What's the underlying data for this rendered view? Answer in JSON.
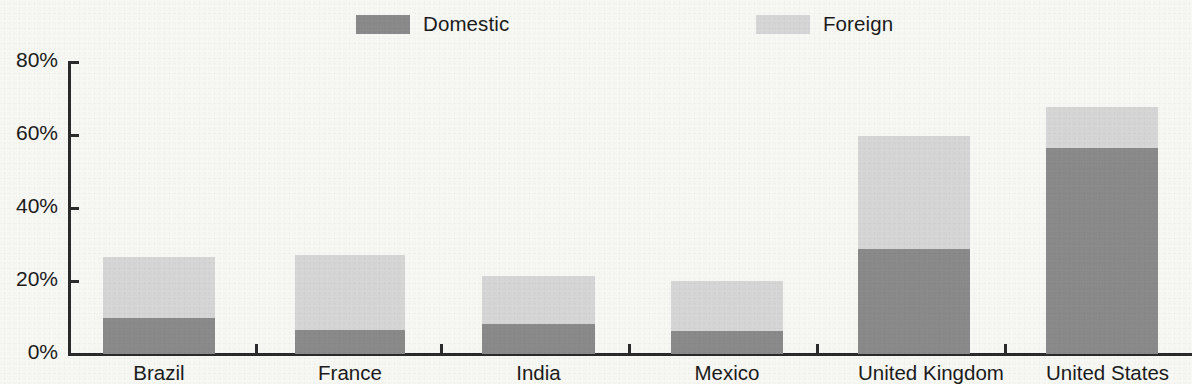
{
  "legend": {
    "position": "top",
    "entries": [
      {
        "label": "Domestic",
        "key": "domestic",
        "color": "#8a8a8a",
        "icon": "legend-swatch-icon"
      },
      {
        "label": "Foreign",
        "key": "foreign",
        "color": "#d6d6d6",
        "icon": "legend-swatch-icon"
      }
    ]
  },
  "axes": {
    "y": {
      "tick_labels": [
        "0%",
        "20%",
        "40%",
        "60%",
        "80%"
      ],
      "min": 0,
      "max": 80,
      "label": ""
    },
    "x": {
      "label": ""
    }
  },
  "chart_data": {
    "type": "bar",
    "subtype": "stacked-bar",
    "title": "",
    "subtitle": "",
    "xlabel": "",
    "ylabel": "",
    "ylim": [
      0,
      80
    ],
    "ytick_values": [
      0,
      20,
      40,
      60,
      80
    ],
    "ytick_labels": [
      "0%",
      "20%",
      "40%",
      "60%",
      "80%"
    ],
    "grid": false,
    "legend_position": "top",
    "units": "percent",
    "categories": [
      "Brazil",
      "France",
      "India",
      "Mexico",
      "United Kingdom",
      "United States"
    ],
    "series": [
      {
        "name": "Domestic",
        "color": "#8a8a8a",
        "values": [
          9.8,
          6.5,
          8.3,
          6.3,
          28.8,
          56.5
        ]
      },
      {
        "name": "Foreign",
        "color": "#d6d6d6",
        "values": [
          16.7,
          20.5,
          13.2,
          13.7,
          31.0,
          11.3
        ]
      }
    ],
    "totals": [
      26.5,
      27.0,
      21.5,
      20.0,
      59.8,
      67.8
    ]
  }
}
